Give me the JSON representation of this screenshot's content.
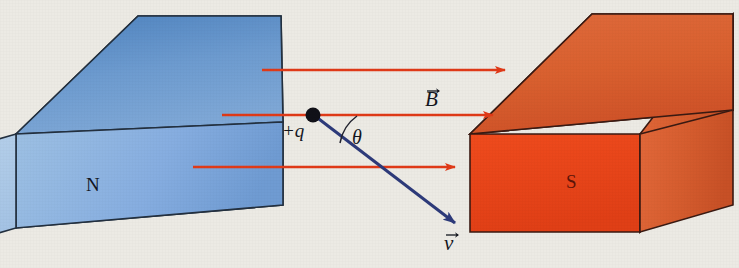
{
  "figure": {
    "background_color": "#eceae4",
    "width": 739,
    "height": 268
  },
  "magnets": {
    "north": {
      "label": "N",
      "face_color": "#a9c6e6",
      "top_color": "#5f8fc6",
      "side_color": "#80a8d4",
      "edge_color": "#23303f"
    },
    "south": {
      "label": "S",
      "face_color": "#e8431a",
      "top_color": "#d9653c",
      "side_color": "#c9471f",
      "edge_color": "#3a1a12"
    }
  },
  "field": {
    "vector_label": "B",
    "arrow_color": "#e03a18",
    "arrow_count": 3,
    "direction": "left-to-right"
  },
  "charge": {
    "label": "+q",
    "dot_color": "#111118",
    "sign": "positive"
  },
  "velocity": {
    "vector_label": "v",
    "arrow_color": "#2d3a7a",
    "direction": "down-right"
  },
  "angle": {
    "label": "θ",
    "arc_color": "#232430",
    "between": "B and v"
  }
}
